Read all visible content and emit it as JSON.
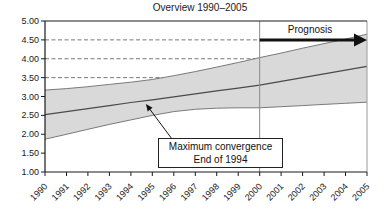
{
  "title": "Overview 1990–2005",
  "prognosis": {
    "label": "Prognosis"
  },
  "annotation": {
    "line1": "Maximum convergence",
    "line2": "End of 1994"
  },
  "chart_data": {
    "type": "area",
    "title": "Overview 1990–2005",
    "x": [
      1990,
      1991,
      1992,
      1993,
      1994,
      1995,
      1996,
      1997,
      1998,
      1999,
      2000,
      2001,
      2002,
      2003,
      2004,
      2005
    ],
    "series": [
      {
        "name": "upper bound",
        "values": [
          3.17,
          3.21,
          3.26,
          3.32,
          3.38,
          3.45,
          3.55,
          3.66,
          3.78,
          3.9,
          4.03,
          4.15,
          4.28,
          4.4,
          4.52,
          4.65
        ]
      },
      {
        "name": "central trend",
        "values": [
          2.52,
          2.6,
          2.68,
          2.76,
          2.84,
          2.91,
          2.99,
          3.07,
          3.15,
          3.22,
          3.3,
          3.4,
          3.5,
          3.6,
          3.7,
          3.8
        ]
      },
      {
        "name": "lower bound",
        "values": [
          1.87,
          2.0,
          2.13,
          2.26,
          2.38,
          2.5,
          2.6,
          2.66,
          2.69,
          2.7,
          2.7,
          2.73,
          2.76,
          2.79,
          2.82,
          2.85
        ]
      }
    ],
    "ylim": [
      1.0,
      5.0
    ],
    "ytick_step": 0.5,
    "ytick_labels": [
      "5.00",
      "4.50",
      "4.00",
      "3.50",
      "3.00",
      "2.50",
      "2.00",
      "1.50",
      "1.00"
    ],
    "grid_dashed_levels": [
      3.5,
      4.0,
      4.5
    ],
    "vertical_marker_year": 2000,
    "prognosis_arrow": {
      "y": 4.5,
      "from_x": 2000,
      "to_x": 2005,
      "label": "Prognosis"
    },
    "annotation": {
      "text": [
        "Maximum convergence",
        "End of 1994"
      ],
      "points_to": {
        "x": 1994.7,
        "y": 2.88
      }
    },
    "legend": "none",
    "colors": {
      "band_fill": "#d9d9d9",
      "band_edge": "#7a7a7a",
      "center_line": "#4a4a4a",
      "grid_dashed": "#777777",
      "axis": "#1a1a1a",
      "marker_line": "#8a8a8a",
      "right_border": "#9a9a9a",
      "arrow": "#111111"
    }
  }
}
